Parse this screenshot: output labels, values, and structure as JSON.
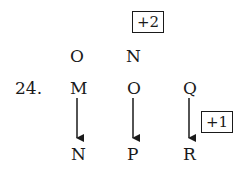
{
  "question_number": "24.",
  "top_label": "+2",
  "side_label": "+1",
  "row_above": [
    "O",
    "N"
  ],
  "row_middle": [
    "M",
    "O",
    "Q"
  ],
  "row_bottom": [
    "N",
    "P",
    "R"
  ]
}
